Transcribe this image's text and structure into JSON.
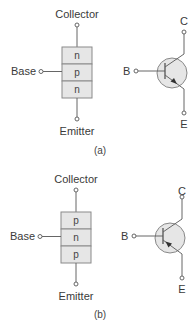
{
  "figure": {
    "panels": [
      {
        "id": "a",
        "caption": "(a)",
        "type": "npn",
        "block": {
          "top_label": "Collector",
          "bottom_label": "Emitter",
          "side_label": "Base",
          "layers": [
            "n",
            "p",
            "n"
          ]
        },
        "symbol": {
          "base": "B",
          "collector": "C",
          "emitter": "E",
          "arrow": "outward"
        }
      },
      {
        "id": "b",
        "caption": "(b)",
        "type": "pnp",
        "block": {
          "top_label": "Collector",
          "bottom_label": "Emitter",
          "side_label": "Base",
          "layers": [
            "p",
            "n",
            "p"
          ]
        },
        "symbol": {
          "base": "B",
          "collector": "C",
          "emitter": "E",
          "arrow": "inward"
        }
      }
    ],
    "colors": {
      "line": "#666666",
      "fill": "#e6e6e6",
      "block_border": "#8a8a8a",
      "text": "#3a3a3a"
    }
  }
}
